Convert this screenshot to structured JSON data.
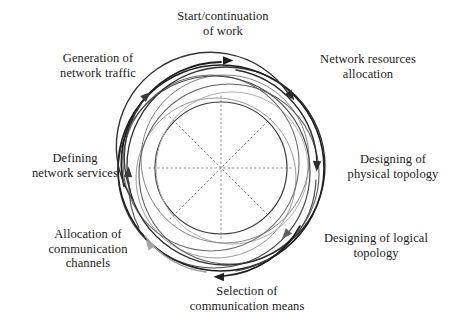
{
  "figure": {
    "type": "cyclic-spiral-diagram",
    "background_color": "#ffffff",
    "center": {
      "x": 221,
      "y": 168
    },
    "stroke_colors": {
      "dark": "#1e1e1e",
      "mid_dark": "#3d3d3d",
      "mid": "#5a5a5a",
      "light": "#8a8a8a",
      "lighter": "#a8a8a8",
      "faint": "#c2c2c2",
      "spoke": "#8d8d8d"
    },
    "rings": [
      {
        "id": "ring-1",
        "cx": 221,
        "cy": 168,
        "r": 103,
        "color": "#1e1e1e",
        "width": 1.6
      },
      {
        "id": "ring-2",
        "cx": 226,
        "cy": 166,
        "r": 99,
        "color": "#2f2f2f",
        "width": 1.3
      },
      {
        "id": "ring-3",
        "cx": 214,
        "cy": 172,
        "r": 96,
        "color": "#4a4a4a",
        "width": 1.2
      },
      {
        "id": "ring-4",
        "cx": 229,
        "cy": 174,
        "r": 90,
        "color": "#5e5e5e",
        "width": 1.1
      },
      {
        "id": "ring-5",
        "cx": 211,
        "cy": 163,
        "r": 88,
        "color": "#6f6f6f",
        "width": 1.1
      },
      {
        "id": "ring-6",
        "cx": 225,
        "cy": 159,
        "r": 84,
        "color": "#848484",
        "width": 1.0
      },
      {
        "id": "ring-7",
        "cx": 216,
        "cy": 178,
        "r": 80,
        "color": "#9a9a9a",
        "width": 1.0
      },
      {
        "id": "ring-8",
        "cx": 232,
        "cy": 168,
        "r": 76,
        "color": "#b0b0b0",
        "width": 1.0
      },
      {
        "id": "ring-9",
        "cx": 221,
        "cy": 168,
        "r": 66,
        "color": "#3a3a3a",
        "width": 1.2
      }
    ],
    "spokes": {
      "count": 4,
      "angles_deg": [
        0,
        45,
        90,
        135
      ],
      "radius": 72,
      "style": "dotted",
      "color": "#8d8d8d"
    },
    "arrow_markers": [
      {
        "id": "arrow-start",
        "x": 223,
        "y": 60,
        "rotation": 0,
        "color": "#1e1e1e"
      },
      {
        "id": "arrow-resources",
        "x": 289,
        "y": 92,
        "rotation": 52,
        "color": "#2b2b2b"
      },
      {
        "id": "arrow-physical",
        "x": 318,
        "y": 161,
        "rotation": 92,
        "color": "#2b2b2b"
      },
      {
        "id": "arrow-logical",
        "x": 289,
        "y": 231,
        "rotation": 132,
        "color": "#5e5e5e"
      },
      {
        "id": "arrow-means",
        "x": 223,
        "y": 277,
        "rotation": 182,
        "color": "#1e1e1e"
      },
      {
        "id": "arrow-channels",
        "x": 152,
        "y": 248,
        "rotation": 234,
        "color": "#a0a0a0"
      },
      {
        "id": "arrow-services",
        "x": 127,
        "y": 176,
        "rotation": 275,
        "color": "#3a3a3a"
      },
      {
        "id": "arrow-traffic",
        "x": 143,
        "y": 98,
        "rotation": 318,
        "color": "#3a3a3a"
      }
    ]
  },
  "stages": [
    {
      "id": "start-continuation-of-work",
      "index": 1,
      "label": "Start/continuation\nof work",
      "position": "top"
    },
    {
      "id": "network-resources-allocation",
      "index": 2,
      "label": "Network resources\nallocation",
      "position": "top-right"
    },
    {
      "id": "designing-of-physical-topology",
      "index": 3,
      "label": "Designing of\nphysical topology",
      "position": "right"
    },
    {
      "id": "designing-of-logical-topology",
      "index": 4,
      "label": "Designing of logical\ntopology",
      "position": "bottom-right"
    },
    {
      "id": "selection-of-communication-means",
      "index": 5,
      "label": "Selection of\ncommunication means",
      "position": "bottom"
    },
    {
      "id": "allocation-of-communication-channels",
      "index": 6,
      "label": "Allocation of\ncommunication\nchannels",
      "position": "bottom-left"
    },
    {
      "id": "defining-network-services",
      "index": 7,
      "label": "Defining\nnetwork services",
      "position": "left"
    },
    {
      "id": "generation-of-network-traffic",
      "index": 8,
      "label": "Generation of\nnetwork traffic",
      "position": "top-left"
    }
  ]
}
